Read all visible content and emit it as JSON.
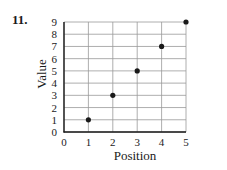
{
  "problem": {
    "number": "11."
  },
  "chart_data": {
    "type": "scatter",
    "title": "",
    "xlabel": "Position",
    "ylabel": "Value",
    "x": [
      1,
      2,
      3,
      4,
      5
    ],
    "y": [
      1,
      3,
      5,
      7,
      9
    ],
    "series": [
      {
        "name": "points",
        "x": [
          1,
          2,
          3,
          4,
          5
        ],
        "values": [
          1,
          3,
          5,
          7,
          9
        ]
      }
    ],
    "xlim": [
      0,
      5
    ],
    "ylim": [
      0,
      9
    ],
    "xticks": [
      "0",
      "1",
      "2",
      "3",
      "4",
      "5"
    ],
    "yticks": [
      "0",
      "1",
      "2",
      "3",
      "4",
      "5",
      "6",
      "7",
      "8",
      "9"
    ],
    "grid": true,
    "legend": "none",
    "marker_color": "#1a1a1a",
    "grid_color": "#999999"
  }
}
